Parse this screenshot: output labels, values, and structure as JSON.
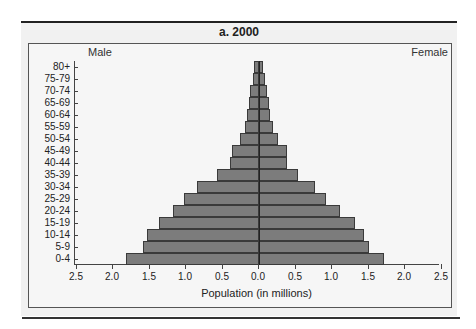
{
  "figure": {
    "title": "a. 2000",
    "left_label": "Male",
    "right_label": "Female",
    "x_axis_title": "Population (in millions)",
    "bar_color": "#7c7c7c",
    "panel_color": "#f1f1f1"
  },
  "chart_data": {
    "type": "bar",
    "orientation": "horizontal-diverging",
    "title": "a. 2000",
    "xlabel": "Population (in millions)",
    "ylabel": "",
    "xlim": [
      -2.5,
      2.5
    ],
    "x_tick_labels": [
      "2.5",
      "2.0",
      "1.5",
      "1.0",
      "0.5",
      "0.0",
      "0.5",
      "1.0",
      "1.5",
      "2.0",
      "2.5"
    ],
    "categories": [
      "80+",
      "75-79",
      "70-74",
      "65-69",
      "60-64",
      "55-59",
      "50-54",
      "45-49",
      "40-44",
      "35-39",
      "30-34",
      "25-29",
      "20-24",
      "15-19",
      "10-14",
      "5-9",
      "0-4"
    ],
    "series": [
      {
        "name": "Male",
        "values": [
          0.07,
          0.08,
          0.12,
          0.14,
          0.16,
          0.19,
          0.26,
          0.37,
          0.4,
          0.58,
          0.85,
          1.03,
          1.18,
          1.37,
          1.53,
          1.59,
          1.82
        ]
      },
      {
        "name": "Female",
        "values": [
          0.05,
          0.08,
          0.11,
          0.14,
          0.15,
          0.19,
          0.26,
          0.38,
          0.38,
          0.53,
          0.77,
          0.92,
          1.11,
          1.32,
          1.44,
          1.51,
          1.71
        ]
      }
    ],
    "legend": [
      "Male",
      "Female"
    ],
    "grid": false
  }
}
